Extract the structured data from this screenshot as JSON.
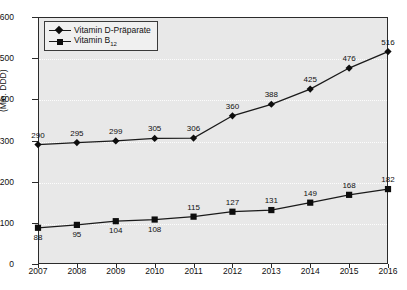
{
  "chart_data": {
    "type": "line",
    "title": "",
    "xlabel": "",
    "ylabel": "(Mio. DDD)",
    "categories": [
      "2007",
      "2008",
      "2009",
      "2010",
      "2011",
      "2012",
      "2013",
      "2014",
      "2015",
      "2016"
    ],
    "ylim": [
      0,
      600
    ],
    "yticks": [
      0,
      100,
      200,
      300,
      400,
      500,
      600
    ],
    "grid": true,
    "legend_position": "top-left",
    "series": [
      {
        "name": "Vitamin D-Präparate",
        "marker": "diamond",
        "values": [
          290,
          295,
          299,
          305,
          306,
          360,
          388,
          425,
          476,
          516
        ],
        "label_position": "above"
      },
      {
        "name": "Vitamin B",
        "name_subscript": "12",
        "marker": "square",
        "values": [
          88,
          95,
          104,
          108,
          115,
          127,
          131,
          149,
          168,
          182
        ],
        "label_position": "mixed"
      }
    ]
  },
  "colors": {
    "plot_background": "#e8e8e8",
    "figure_background": "#ffffff",
    "axis": "#2b2b2b",
    "series_line": "#1a1a1a",
    "marker": "#0d0d0d",
    "gridline": "#ffffff",
    "text": "#111111",
    "legend_background": "#f0f0f0"
  },
  "legend": {
    "items": [
      {
        "label": "Vitamin D-Präparate"
      },
      {
        "label": "Vitamin B",
        "sub": "12"
      }
    ]
  }
}
